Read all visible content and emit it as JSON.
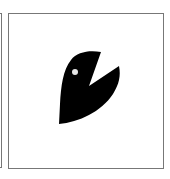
{
  "tiles": [
    {
      "label": "",
      "selected": false
    },
    {
      "label": "",
      "icon": "bird-head-icon",
      "icon_color": "#000000",
      "highlight_color": "#ffffff"
    }
  ]
}
